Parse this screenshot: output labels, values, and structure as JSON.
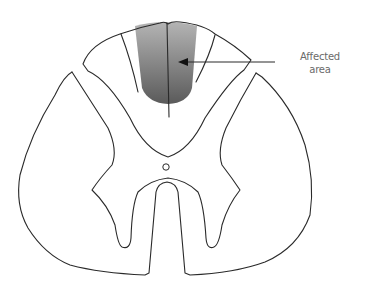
{
  "figure": {
    "type": "spinal-cord-cross-section",
    "annotation": {
      "line1": "Affected",
      "line2": "area"
    },
    "colors": {
      "outline": "#2a2a2a",
      "shade_top": "#a8a8a8",
      "shade_bottom": "#5c5c5c",
      "label": "#6a6a6a"
    }
  }
}
